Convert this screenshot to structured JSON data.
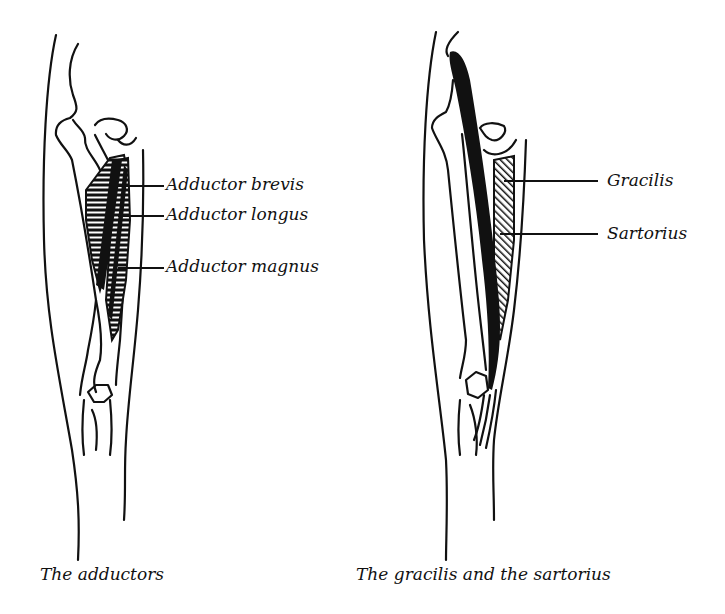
{
  "figures": [
    {
      "id": "adductors",
      "caption": "The adductors",
      "labels": [
        {
          "text": "Adductor brevis",
          "x": 166,
          "y": 178
        },
        {
          "text": "Adductor longus",
          "x": 166,
          "y": 208
        },
        {
          "text": "Adductor magnus",
          "x": 166,
          "y": 260
        }
      ]
    },
    {
      "id": "gracilis-sartorius",
      "caption": "The gracilis and the sartorius",
      "labels": [
        {
          "text": "Gracilis",
          "x": 607,
          "y": 173
        },
        {
          "text": "Sartorius",
          "x": 607,
          "y": 226
        }
      ]
    }
  ],
  "colors": {
    "ink": "#111111",
    "background": "#ffffff"
  }
}
